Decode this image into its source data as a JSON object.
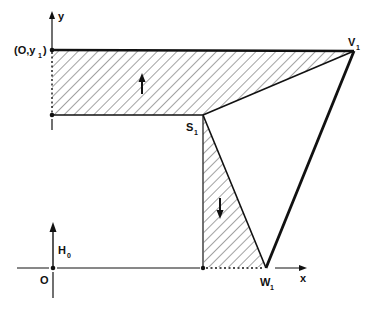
{
  "figure": {
    "axes": {
      "x_label": "x",
      "y_label": "y",
      "origin_label": "O"
    },
    "points": {
      "y1_label": "(O,y",
      "y1_sub": "1",
      "y1_close": ")",
      "V1_label": "V",
      "V1_sub": "1",
      "S1_label": "S",
      "S1_sub": "1",
      "W1_label": "W",
      "W1_sub": "1"
    },
    "vector": {
      "label": "H",
      "sub": "0"
    },
    "regions": [
      {
        "name": "upper-hatched-region",
        "arrow": "up"
      },
      {
        "name": "lower-hatched-region",
        "arrow": "down"
      }
    ],
    "colors": {
      "ink": "#111111",
      "hatch": "#555555",
      "background": "#ffffff"
    }
  }
}
